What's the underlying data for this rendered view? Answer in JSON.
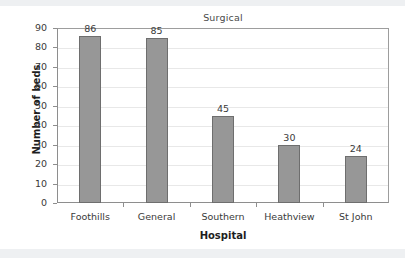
{
  "chart_data": {
    "type": "bar",
    "title": "Surgical",
    "xlabel": "Hospital",
    "ylabel": "Number of beds",
    "categories": [
      "Foothills",
      "General",
      "Southern",
      "Heathview",
      "St John"
    ],
    "values": [
      86,
      85,
      45,
      30,
      24
    ],
    "value_labels": [
      "86",
      "85",
      "45",
      "30",
      "24"
    ],
    "ylim": [
      0,
      90
    ],
    "ytick_step": 10,
    "ytick_labels": [
      "90",
      "80",
      "70",
      "60",
      "50",
      "40",
      "30",
      "20",
      "10",
      "0"
    ],
    "grid": "horizontal",
    "legend": "none",
    "colors": {
      "bar_fill": "#979797",
      "bar_edge": "#6e6e6e",
      "gridline": "#e8e8e8",
      "axis": "#8e8e8e",
      "text": "#3a3a3a",
      "title_text": "#4a4a4a",
      "axis_title_text": "#1e1e1e",
      "background": "#ffffff"
    }
  }
}
